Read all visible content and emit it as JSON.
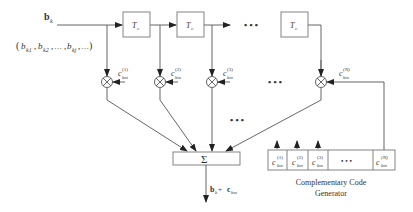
{
  "diagram": {
    "input": {
      "label": "b",
      "label_sub": "k",
      "sequence_text": "(b",
      "sequence": [
        "k1",
        "k2",
        "…",
        "kj",
        "…"
      ]
    },
    "delays": [
      {
        "label": "T",
        "sub": "c"
      },
      {
        "label": "T",
        "sub": "c"
      },
      {
        "label": "T",
        "sub": "c"
      }
    ],
    "ellipsis": "• • •",
    "multipliers": [
      {
        "code_label": "c",
        "sub": "km",
        "sup": "(1)"
      },
      {
        "code_label": "c",
        "sub": "km",
        "sup": "(2)"
      },
      {
        "code_label": "c",
        "sub": "km",
        "sup": "(3)"
      },
      {
        "code_label": "c",
        "sub": "km",
        "sup": "(N)"
      }
    ],
    "summer": {
      "symbol": "Σ"
    },
    "output": {
      "label_b": "b",
      "label_b_sub": "k",
      "plus": " + ",
      "label_c": "c",
      "label_c_sub": "km"
    },
    "generator": {
      "cells": [
        {
          "label": "c",
          "sub": "km",
          "sup": "(1)"
        },
        {
          "label": "c",
          "sub": "km",
          "sup": "(2)"
        },
        {
          "label": "c",
          "sub": "km",
          "sup": "(3)"
        },
        {
          "label": "• • •"
        },
        {
          "label": "c",
          "sub": "km",
          "sup": "(N)"
        }
      ],
      "title_line1": "Complementary Code",
      "title_line2": "Generator"
    },
    "colors": {
      "line": "#555555",
      "text": "#333333"
    }
  }
}
